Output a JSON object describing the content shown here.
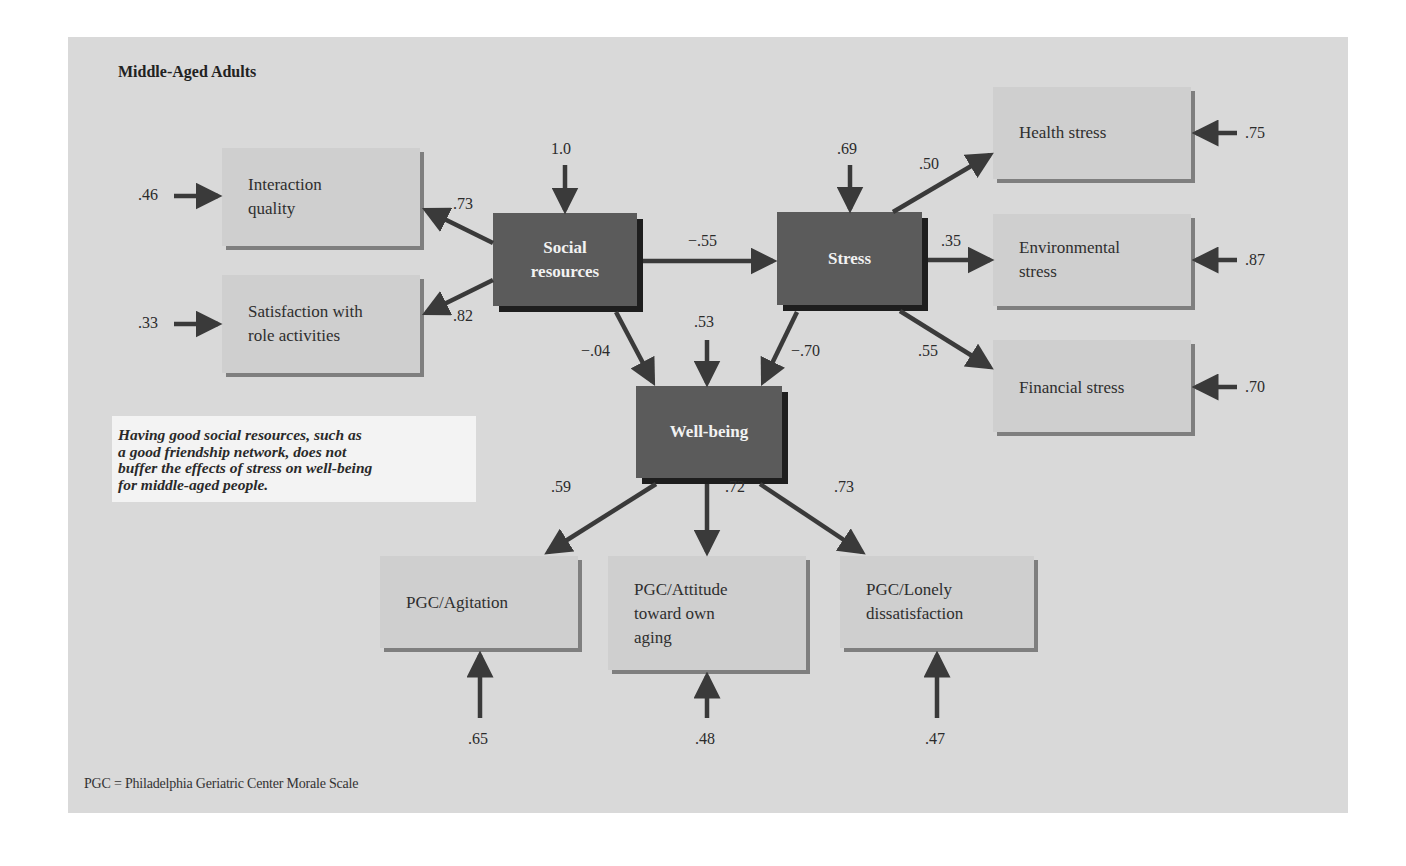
{
  "figure": {
    "title": "Middle-Aged Adults",
    "footnote": "PGC = Philadelphia Geriatric Center Morale Scale",
    "caption": "Having good social resources, such as\na good friendship network, does not\nbuffer the effects of stress on well-being\nfor middle-aged people.",
    "colors": {
      "background": "#d9d9d9",
      "observed_box": "#cfcfcf",
      "latent_box": "#5b5b5b",
      "arrow": "#3a3a3a",
      "caption_box": "#f3f3f3"
    }
  },
  "latent": {
    "social_resources": {
      "label": "Social\nresources",
      "error": "1.0"
    },
    "stress": {
      "label": "Stress",
      "error": ".69"
    },
    "well_being": {
      "label": "Well-being",
      "error": ".53"
    }
  },
  "observed": {
    "interaction_quality": {
      "label": "Interaction\nquality",
      "loading": ".73",
      "error": ".46"
    },
    "satisfaction_roles": {
      "label": "Satisfaction with\nrole activities",
      "loading": ".82",
      "error": ".33"
    },
    "health_stress": {
      "label": "Health stress",
      "loading": ".50",
      "error": ".75"
    },
    "environmental_stress": {
      "label": "Environmental\nstress",
      "loading": ".35",
      "error": ".87"
    },
    "financial_stress": {
      "label": "Financial stress",
      "loading": ".55",
      "error": ".70"
    },
    "pgc_agitation": {
      "label": "PGC/Agitation",
      "loading": ".59",
      "error": ".65"
    },
    "pgc_attitude": {
      "label": "PGC/Attitude\ntoward own\naging",
      "loading": ".72",
      "error": ".48"
    },
    "pgc_lonely": {
      "label": "PGC/Lonely\ndissatisfaction",
      "loading": ".73",
      "error": ".47"
    }
  },
  "paths": {
    "social_to_stress": "−.55",
    "social_to_wellbeing": "−.04",
    "stress_to_wellbeing": "−.70"
  }
}
